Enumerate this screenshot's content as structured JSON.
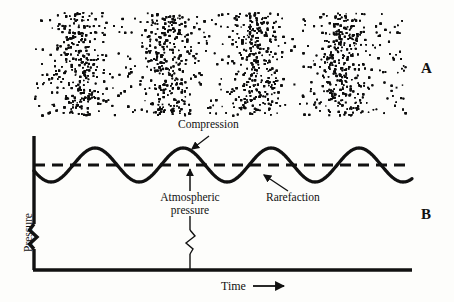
{
  "figure": {
    "background_color": "#fdfdfb",
    "ink_color": "#111111",
    "panels": [
      {
        "letter": "A",
        "caption": "Particle density representation of a sound wave"
      },
      {
        "letter": "B",
        "caption": "Pressure versus time graph of the same sound wave"
      }
    ]
  },
  "panel_a": {
    "letter": "A",
    "dot_field": {
      "left": 33,
      "top": 12,
      "width": 372,
      "height": 103,
      "dot_color": "#0d0d0d",
      "dot_size_px": 1.6,
      "base_density": "uniform scatter",
      "compression_band_centers": [
        78,
        166,
        255,
        343
      ],
      "band_count": 4,
      "wavelength_px": 88
    }
  },
  "panel_b": {
    "letter": "B",
    "axes": {
      "y_label": "Pressure",
      "x_label": "Time",
      "x_arrow_glyph": "arrow-right",
      "y_axis_x": 34,
      "y_axis_top": 136,
      "x_axis_y": 270,
      "x_axis_right": 412,
      "break_symbol": "zigzag-axis-break"
    },
    "reference_line": {
      "label": "Atmospheric pressure",
      "style": "dashed",
      "y": 165,
      "x_start": 34,
      "x_end": 412
    },
    "annotations": [
      {
        "name": "compression",
        "text": "Compression",
        "text_x": 178,
        "text_y": 120,
        "arrow_from": [
          208,
          137
        ],
        "arrow_to": [
          190,
          150
        ]
      },
      {
        "name": "atmospheric-pressure",
        "text_line1": "Atmospheric",
        "text_line2": "pressure",
        "text_x": 146,
        "text_y": 196,
        "arrow_from": [
          190,
          192
        ],
        "arrow_to": [
          190,
          168
        ]
      },
      {
        "name": "rarefaction",
        "text": "Rarefaction",
        "text_x": 268,
        "text_y": 196,
        "arrow_from": [
          286,
          190
        ],
        "arrow_to": [
          262,
          174
        ]
      }
    ]
  },
  "chart_data": {
    "type": "line",
    "xlabel": "Time",
    "ylabel": "Pressure",
    "series": [
      {
        "name": "Sound pressure",
        "waveform": "sinusoid",
        "amplitude_px": 17,
        "wavelength_px": 88,
        "baseline_y_px": 165,
        "x_start_px": 34,
        "x_end_px": 412,
        "phase_deg": 200,
        "cycles": 4.3,
        "line_color": "#111111",
        "line_width_px": 3.2
      },
      {
        "name": "Atmospheric pressure",
        "waveform": "constant",
        "value_y_px": 165,
        "line_style": "dashed",
        "line_color": "#111111",
        "line_width_px": 3.2
      }
    ],
    "crest_x_px": [
      78,
      166,
      255,
      343
    ],
    "trough_x_px": [
      122,
      210,
      299,
      387
    ],
    "crest_label": "Compression",
    "trough_label": "Rarefaction",
    "baseline_label": "Atmospheric pressure",
    "grid": false,
    "legend": "none",
    "axis_break": true
  }
}
